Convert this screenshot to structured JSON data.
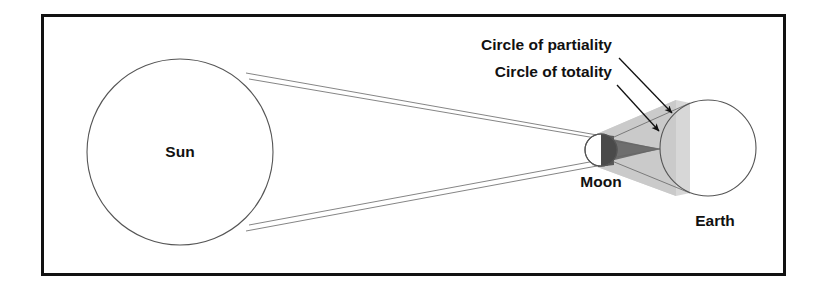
{
  "figure": {
    "background_color": "#ffffff",
    "frame": {
      "name": "outer-frame",
      "stroke_color": "#111111",
      "stroke_width": 3,
      "x": 41,
      "y": 14,
      "width": 745,
      "height": 262
    }
  },
  "bodies": {
    "sun": {
      "label": "Sun",
      "cx": 180,
      "cy": 152,
      "r": 93,
      "stroke_color": "#555555",
      "fill_color": "#ffffff",
      "label_x": 180,
      "label_y": 157
    },
    "moon": {
      "label": "Moon",
      "cx": 601,
      "cy": 150,
      "r": 16,
      "stroke_color": "#555555",
      "fill_color": "#ffffff",
      "shadow_half_color": "#4a4a4a",
      "label_x": 601,
      "label_y": 187
    },
    "earth": {
      "label": "Earth",
      "cx": 708,
      "cy": 148,
      "r": 48,
      "stroke_color": "#555555",
      "fill_color": "#ffffff",
      "label_x": 715,
      "label_y": 226
    }
  },
  "shadow": {
    "umbra": {
      "name": "umbra-cone",
      "fill_color": "#6e6e6e",
      "description": "dark inner shadow cone tapering to a point"
    },
    "penumbra": {
      "name": "penumbra-cone",
      "fill_color": "#c9c9c9",
      "description": "light outer shadow cone widening toward Earth"
    }
  },
  "rays": {
    "stroke_color": "#666666",
    "stroke_width": 0.8,
    "count": 4
  },
  "callouts": [
    {
      "id": "circle-of-partiality",
      "text": "Circle of partiality",
      "text_x": 612,
      "text_y": 50,
      "anchor": "end",
      "arrow_from_x": 619,
      "arrow_from_y": 58,
      "arrow_to_x": 672,
      "arrow_to_y": 113
    },
    {
      "id": "circle-of-totality",
      "text": "Circle of totality",
      "text_x": 612,
      "text_y": 77,
      "anchor": "end",
      "arrow_from_x": 617,
      "arrow_from_y": 85,
      "arrow_to_x": 659,
      "arrow_to_y": 131
    }
  ],
  "colors": {
    "ink": "#111111",
    "outline": "#555555",
    "umbra": "#6e6e6e",
    "penumbra": "#c9c9c9"
  }
}
